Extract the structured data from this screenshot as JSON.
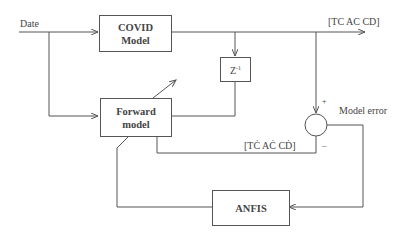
{
  "diagram": {
    "input_label": "Date",
    "output_label": "[TC AC CD]",
    "estimate_label": "[TĊ AĊ CḊ]",
    "error_label": "Model error",
    "plus_sign": "+",
    "minus_sign": "–",
    "blocks": {
      "covid": {
        "line1": "COVID",
        "line2": "Model"
      },
      "delay": {
        "base": "Z",
        "exp": "-1"
      },
      "forward": {
        "line1": "Forward",
        "line2": "model"
      },
      "anfis": {
        "label": "ANFIS"
      }
    },
    "colors": {
      "line": "#555555",
      "text": "#444444",
      "background": "#ffffff"
    }
  }
}
